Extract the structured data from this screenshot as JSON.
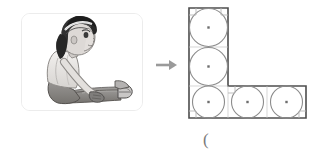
{
  "page": {
    "background_color": "#ffffff",
    "width": 325,
    "height": 156
  },
  "photo_card": {
    "alt_text": "Child sitting on floor with legs extended forward, side view",
    "border_color": "#ececec",
    "background_color": "#ffffff",
    "illustration": {
      "subject": "seated child, profile view",
      "style": "grayscale cartoon",
      "hair_color": "#2e2e2e",
      "skin_color": "#d8d4d1",
      "shirt_color": "#e6e4e2",
      "pants_color": "#8f8d8c",
      "shoe_color": "#b9b7b6"
    }
  },
  "transition": {
    "arrow_label": "right-arrow",
    "arrow_color": "#9a9a9a",
    "direction": "right"
  },
  "figure": {
    "shape_name": "L-shaped polygon",
    "outline_color": "#4d4d4d",
    "circle_color": "#8c8c8c",
    "center_dot_color": "#6e6e6e",
    "right_angle_mark_color": "#b5b5b5",
    "cell_size_px": 39,
    "circle_count": 5,
    "cells": [
      {
        "id": "cell-top",
        "col": 0,
        "row": 0
      },
      {
        "id": "cell-middle",
        "col": 0,
        "row": 1
      },
      {
        "id": "cell-bottom-left",
        "col": 0,
        "row": 2
      },
      {
        "id": "cell-bottom-center",
        "col": 1,
        "row": 2
      },
      {
        "id": "cell-bottom-right",
        "col": 2,
        "row": 2
      }
    ],
    "vertices": [
      [
        0,
        0
      ],
      [
        1,
        0
      ],
      [
        1,
        2
      ],
      [
        3,
        2
      ],
      [
        3,
        3
      ],
      [
        0,
        3
      ]
    ],
    "right_angle_marks": [
      {
        "id": "corner-top-left",
        "col": 0,
        "row": 0
      },
      {
        "id": "corner-top-right",
        "col": 1,
        "row": 0
      },
      {
        "id": "corner-inner",
        "col": 1,
        "row": 2
      },
      {
        "id": "corner-bottom-right",
        "col": 3,
        "row": 3
      },
      {
        "id": "corner-bottom-left",
        "col": 0,
        "row": 3
      }
    ]
  },
  "caption": {
    "text": "("
  }
}
